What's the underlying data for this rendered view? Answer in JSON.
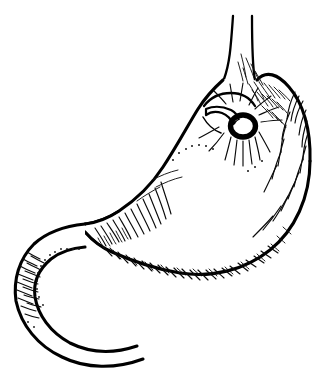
{
  "figure": {
    "style": "black ink line art with hatching",
    "background_color": "#ffffff",
    "ink_color": "#000000",
    "width": 332,
    "height": 374,
    "caption": "",
    "labels": [],
    "annotations": [],
    "parts": [
      {
        "id": "esophagus",
        "name": "esophagus",
        "note": "narrow vertical tube entering at top"
      },
      {
        "id": "cardia",
        "name": "cardia / gastroesophageal junction",
        "note": "junction below esophagus"
      },
      {
        "id": "fundus",
        "name": "fundus",
        "note": "rounded dome upper right"
      },
      {
        "id": "body",
        "name": "body of stomach",
        "note": "large curved sac"
      },
      {
        "id": "lesser-curvature",
        "name": "lesser curvature",
        "note": "upper left concave border"
      },
      {
        "id": "greater-curvature",
        "name": "greater curvature",
        "note": "lower right convex border"
      },
      {
        "id": "antrum",
        "name": "pyloric antrum",
        "note": "tapering lower left region"
      },
      {
        "id": "pylorus",
        "name": "pylorus",
        "note": "narrow waist joining duodenum"
      },
      {
        "id": "duodenal-bulb",
        "name": "duodenal bulb",
        "note": "rounded first part of duodenum"
      },
      {
        "id": "duodenum",
        "name": "duodenum",
        "note": "C-shaped tube curving to lower right"
      },
      {
        "id": "ring-lesion",
        "name": "ring lesion at cardia",
        "note": "dark oval ring with white lumen and radiating folds"
      },
      {
        "id": "band-strap",
        "name": "band across cardia",
        "note": "pale strap crossing left of the ring"
      }
    ],
    "shading": {
      "technique": "parallel short strokes",
      "regions": [
        "right margin of fundus",
        "inner greater curvature",
        "radiating folds around ring lesion",
        "pylorus and antrum junction",
        "outer wall of duodenal bulb"
      ]
    },
    "colors": {
      "background": "#ffffff",
      "ink": "#000000",
      "hatch": "#121212"
    }
  }
}
